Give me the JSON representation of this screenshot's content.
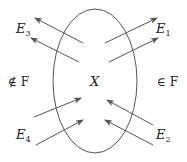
{
  "diagram": {
    "set_label": "X",
    "outside_left_label": "∉ F",
    "outside_right_label": "∈ F",
    "edges": [
      {
        "name": "E1",
        "base": "E",
        "sub": "1",
        "direction": "outgoing",
        "side": "upper-right"
      },
      {
        "name": "E2",
        "base": "E",
        "sub": "2",
        "direction": "incoming",
        "side": "lower-right"
      },
      {
        "name": "E3",
        "base": "E",
        "sub": "3",
        "direction": "outgoing",
        "side": "upper-left"
      },
      {
        "name": "E4",
        "base": "E",
        "sub": "4",
        "direction": "incoming",
        "side": "lower-left"
      }
    ],
    "colors": {
      "stroke": "#555555",
      "text": "#222222",
      "background": "#ffffff"
    }
  }
}
